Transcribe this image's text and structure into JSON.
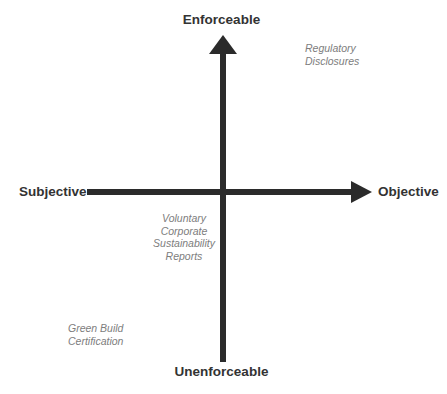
{
  "canvas": {
    "width": 447,
    "height": 394,
    "background": "#ffffff"
  },
  "colors": {
    "axis": "#2b2b2b",
    "pole_label": "#333333",
    "annotation": "#7d7d7d"
  },
  "axes": {
    "vertical": {
      "name": "enforceability-axis",
      "top_pole": "Enforceable",
      "bottom_pole": "Unenforceable",
      "arrow_direction": "up"
    },
    "horizontal": {
      "name": "objectivity-axis",
      "left_pole": "Subjective",
      "right_pole": "Objective",
      "arrow_direction": "right"
    }
  },
  "poles": {
    "top": "Enforceable",
    "bottom": "Unenforceable",
    "left": "Subjective",
    "right": "Objective"
  },
  "annotations": [
    {
      "id": "regulatory-disclosures",
      "quadrant": "top-right",
      "lines": [
        "Regulatory",
        "Disclosures"
      ],
      "line1": "Regulatory",
      "line2": "Disclosures"
    },
    {
      "id": "voluntary-corporate-sustainability-reports",
      "quadrant": "center-lower",
      "lines": [
        "Voluntary",
        "Corporate",
        "Sustainability",
        "Reports"
      ],
      "line1": "Voluntary",
      "line2": "Corporate",
      "line3": "Sustainability",
      "line4": "Reports"
    },
    {
      "id": "green-build-certification",
      "quadrant": "bottom-left",
      "lines": [
        "Green Build",
        "Certification"
      ],
      "line1": "Green Build",
      "line2": "Certification"
    }
  ]
}
